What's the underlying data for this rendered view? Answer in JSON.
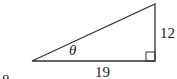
{
  "diagram": {
    "type": "right-triangle",
    "angle_label": "θ",
    "opposite_side": "12",
    "adjacent_side": "19",
    "partial_label": "8",
    "colors": {
      "stroke": "#333333",
      "background": "#ffffff"
    }
  }
}
